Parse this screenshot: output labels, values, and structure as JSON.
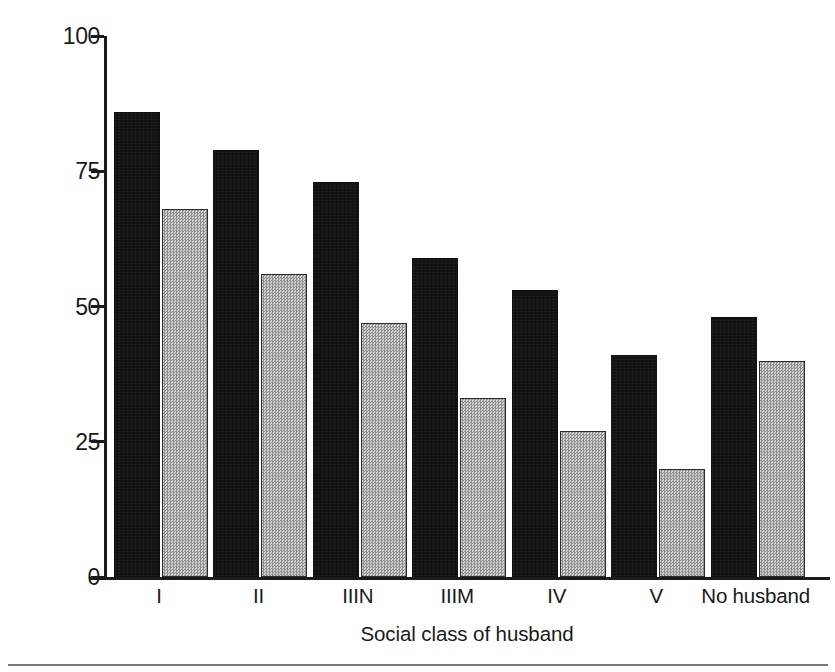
{
  "chart_data": {
    "type": "bar",
    "title": "",
    "xlabel": "Social class of husband",
    "ylabel": "Percentage breast-fed",
    "categories": [
      "I",
      "II",
      "IIIN",
      "IIIM",
      "IV",
      "V",
      "No husband"
    ],
    "series": [
      {
        "name": "series-dark",
        "color": "#111111",
        "values": [
          86,
          79,
          73,
          59,
          53,
          41,
          48
        ]
      },
      {
        "name": "series-light",
        "color": "#b4b4b4",
        "values": [
          68,
          56,
          47,
          33,
          27,
          20,
          40
        ]
      }
    ],
    "ylim": [
      0,
      100
    ],
    "yticks": [
      0,
      25,
      50,
      75,
      100
    ],
    "ytick_labels": [
      "0",
      "25",
      "50",
      "75",
      "100"
    ],
    "grid": false,
    "legend": "none"
  },
  "axis": {
    "y_title": "Percentage breast-fed",
    "x_title": "Social class of husband"
  }
}
